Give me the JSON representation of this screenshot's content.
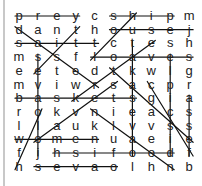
{
  "puzzle": {
    "type": "word-search",
    "rows": [
      [
        "p",
        "r",
        "e",
        "y",
        "c",
        "s",
        "h",
        "i",
        "p",
        "m"
      ],
      [
        "d",
        "a",
        "n",
        "t",
        "h",
        "o",
        "u",
        "s",
        "e",
        "j"
      ],
      [
        "s",
        "a",
        "i",
        "t",
        "t",
        "c",
        "t",
        "e",
        "s",
        "h"
      ],
      [
        "m",
        "s",
        "s",
        "f",
        "l",
        "o",
        "a",
        "v",
        "e",
        "s"
      ],
      [
        "e",
        "e",
        "t",
        "e",
        "d",
        "t",
        "k",
        "w",
        "l",
        "g"
      ],
      [
        "m",
        "v",
        "i",
        "w",
        "r",
        "s",
        "a",
        "c",
        "p",
        "r"
      ],
      [
        "b",
        "a",
        "s",
        "k",
        "e",
        "t",
        "s",
        "g",
        "i",
        "a"
      ],
      [
        "r",
        "o",
        "k",
        "v",
        "n",
        "i",
        "e",
        "a",
        "c",
        "s"
      ],
      [
        "l",
        "l",
        "a",
        "u",
        "k",
        "l",
        "v",
        "v",
        "s",
        "s"
      ],
      [
        "w",
        "o",
        "m",
        "e",
        "n",
        "u",
        "a",
        "e",
        "i",
        "e"
      ],
      [
        "f",
        "j",
        "h",
        "s",
        "i",
        "f",
        "o",
        "o",
        "d",
        "f"
      ],
      [
        "h",
        "s",
        "e",
        "v",
        "a",
        "o",
        "l",
        "h",
        "n",
        "b"
      ]
    ],
    "strike_lines": [
      [
        0,
        0,
        0,
        3
      ],
      [
        0,
        5,
        0,
        8
      ],
      [
        1,
        5,
        1,
        9
      ],
      [
        2,
        0,
        2,
        4
      ],
      [
        3,
        4,
        3,
        9
      ],
      [
        6,
        0,
        6,
        6
      ],
      [
        9,
        0,
        9,
        4
      ],
      [
        10,
        2,
        10,
        8
      ],
      [
        11,
        1,
        11,
        5
      ],
      [
        1,
        0,
        5,
        4
      ],
      [
        3,
        1,
        10,
        1
      ],
      [
        0,
        6,
        3,
        4
      ],
      [
        2,
        7,
        6,
        3
      ],
      [
        7,
        4,
        11,
        8
      ],
      [
        5,
        5,
        9,
        1
      ],
      [
        2,
        6,
        10,
        6
      ],
      [
        6,
        9,
        10,
        9
      ],
      [
        4,
        5,
        9,
        9
      ],
      [
        5,
        7,
        10,
        9
      ],
      [
        7,
        1,
        11,
        0
      ],
      [
        3,
        8,
        10,
        8
      ],
      [
        1,
        3,
        4,
        1
      ]
    ]
  }
}
